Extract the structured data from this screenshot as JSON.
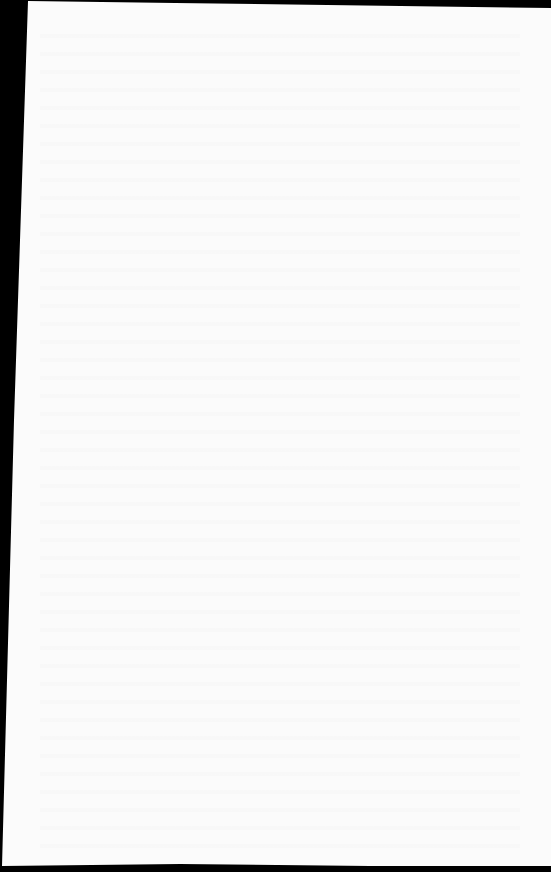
{
  "document": {
    "type": "scanned-page",
    "content": "",
    "background_color": "#000000",
    "page_color": "#fbfbfb"
  }
}
